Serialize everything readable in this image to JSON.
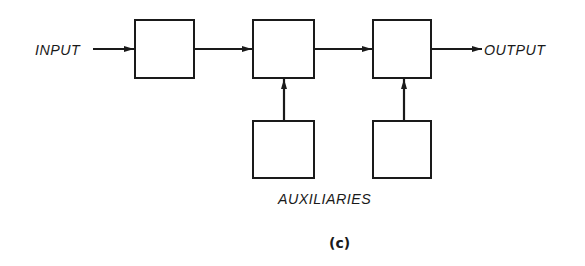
{
  "diagram": {
    "input_label": "INPUT",
    "output_label": "OUTPUT",
    "auxiliaries_label": "AUXILIARIES",
    "caption": "(c)",
    "line_color": "#1a1a1a",
    "blocks": [
      {
        "id": "block-1",
        "role": "main-stage"
      },
      {
        "id": "block-2",
        "role": "main-stage"
      },
      {
        "id": "block-3",
        "role": "main-stage"
      },
      {
        "id": "aux-1",
        "role": "auxiliary",
        "feeds": "block-2"
      },
      {
        "id": "aux-2",
        "role": "auxiliary",
        "feeds": "block-3"
      }
    ],
    "connections": [
      {
        "from": "INPUT",
        "to": "block-1"
      },
      {
        "from": "block-1",
        "to": "block-2"
      },
      {
        "from": "block-2",
        "to": "block-3"
      },
      {
        "from": "block-3",
        "to": "OUTPUT"
      },
      {
        "from": "aux-1",
        "to": "block-2"
      },
      {
        "from": "aux-2",
        "to": "block-3"
      }
    ]
  }
}
